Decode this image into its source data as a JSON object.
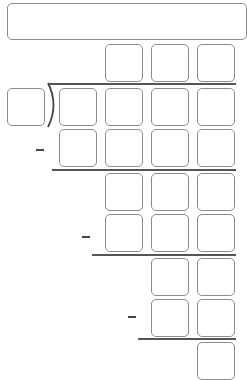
{
  "answer": {
    "value": "",
    "placeholder": ""
  },
  "quotient": {
    "cells": [
      "",
      "",
      ""
    ]
  },
  "divisor": {
    "value": ""
  },
  "dividend": {
    "cells": [
      "",
      "",
      "",
      ""
    ]
  },
  "steps": [
    {
      "subtract": [
        "",
        "",
        "",
        ""
      ],
      "operator": "−"
    },
    {
      "remainder": [
        "",
        "",
        ""
      ],
      "subtract": [
        "",
        "",
        ""
      ],
      "operator": "−"
    },
    {
      "remainder": [
        "",
        ""
      ],
      "subtract": [
        "",
        ""
      ],
      "operator": "−"
    },
    {
      "remainder": [
        ""
      ]
    }
  ],
  "colors": {
    "cell_border": "#8c8c8c",
    "rule": "#555555",
    "background": "#ffffff"
  }
}
